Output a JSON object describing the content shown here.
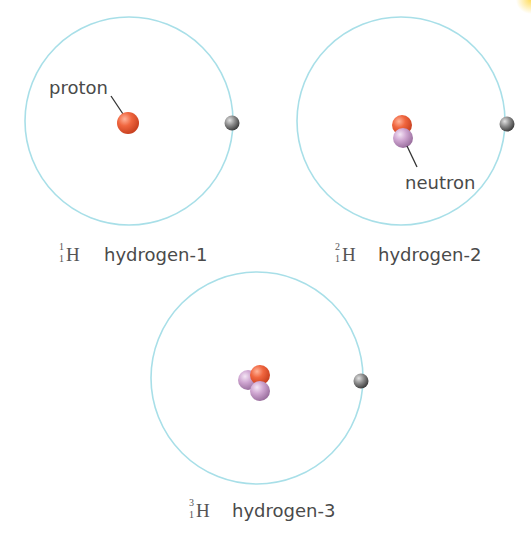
{
  "colors": {
    "orbit": "#a8dfe8",
    "proton": "#e8583a",
    "neutron": "#c89ac9",
    "electron": "#6e6e6e",
    "text": "#4a4a4a",
    "pointer": "#333333"
  },
  "labels": {
    "proton": "proton",
    "neutron": "neutron"
  },
  "atoms": [
    {
      "name": "hydrogen-1",
      "symbol": "H",
      "mass_number": "1",
      "atomic_number": "1",
      "protons": 1,
      "neutrons": 0,
      "electrons": 1
    },
    {
      "name": "hydrogen-2",
      "symbol": "H",
      "mass_number": "2",
      "atomic_number": "1",
      "protons": 1,
      "neutrons": 1,
      "electrons": 1
    },
    {
      "name": "hydrogen-3",
      "symbol": "H",
      "mass_number": "3",
      "atomic_number": "1",
      "protons": 1,
      "neutrons": 2,
      "electrons": 1
    }
  ]
}
